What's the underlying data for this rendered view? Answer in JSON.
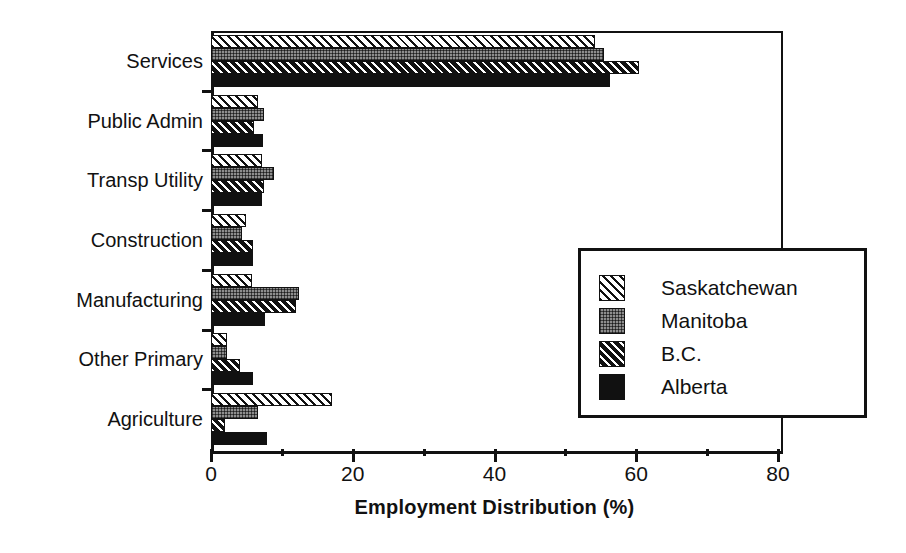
{
  "chart_data": {
    "type": "bar",
    "orientation": "horizontal",
    "title": "",
    "xlabel": "Employment Distribution (%)",
    "ylabel": "",
    "xlim": [
      0,
      80
    ],
    "xticks": [
      0,
      20,
      40,
      60,
      80
    ],
    "xtick_labels": [
      "0",
      "20",
      "40",
      "60",
      "80"
    ],
    "xminorticks": [
      10,
      30,
      50,
      70
    ],
    "grid": false,
    "legend_position": "center-right",
    "categories": [
      "Services",
      "Public Admin",
      "Transp Utility",
      "Construction",
      "Manufacturing",
      "Other Primary",
      "Agriculture"
    ],
    "series": [
      {
        "name": "Saskatchewan",
        "pattern": "white-diagonal-hatch",
        "values": [
          54.2,
          6.6,
          7.2,
          4.9,
          5.8,
          2.3,
          17.1
        ]
      },
      {
        "name": "Manitoba",
        "pattern": "grey-stipple",
        "values": [
          55.5,
          7.5,
          8.9,
          4.4,
          12.4,
          2.3,
          6.6
        ]
      },
      {
        "name": "B.C.",
        "pattern": "black-diagonal-hatch",
        "values": [
          60.4,
          6.1,
          7.5,
          5.9,
          12.0,
          4.1,
          2.0
        ]
      },
      {
        "name": "Alberta",
        "pattern": "solid-black",
        "values": [
          56.3,
          7.3,
          7.2,
          5.9,
          7.6,
          5.9,
          7.9
        ]
      }
    ]
  },
  "legend": {
    "entries": [
      {
        "label": "Saskatchewan"
      },
      {
        "label": "Manitoba"
      },
      {
        "label": "B.C."
      },
      {
        "label": "Alberta"
      }
    ]
  },
  "colors": {
    "ink": "#111111",
    "paper": "#ffffff",
    "manitoba_grey": "#8e8e8e"
  }
}
